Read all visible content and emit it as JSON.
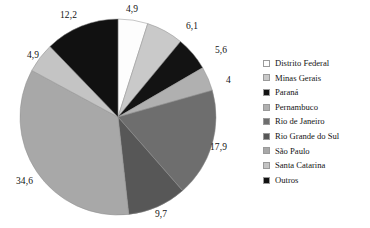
{
  "chart_data": {
    "type": "pie",
    "title": "",
    "categories": [
      "Distrito Federal",
      "Minas Gerais",
      "Paraná",
      "Pernambuco",
      "Rio de Janeiro",
      "Rio Grande do Sul",
      "São Paulo",
      "Santa Catarina",
      "Outros"
    ],
    "values": [
      4.9,
      6.1,
      5.6,
      4,
      17.9,
      9.7,
      34.6,
      4.9,
      12.2
    ],
    "labels": [
      "4,9",
      "6,1",
      "5,6",
      "4",
      "17,9",
      "9,7",
      "34,6",
      "4,9",
      "12,2"
    ],
    "colors": [
      "#fdfdfd",
      "#c9c9c9",
      "#131313",
      "#b0b0b0",
      "#6e6e6e",
      "#575757",
      "#a8a8a8",
      "#c4c4c4",
      "#111111"
    ],
    "start_angle_deg": 0,
    "direction": "clockwise",
    "legend_position": "right",
    "grid": false,
    "xlabel": "",
    "ylabel": ""
  },
  "legend": {
    "items": [
      {
        "label": "Distrito Federal",
        "color": "#fdfdfd"
      },
      {
        "label": "Minas Gerais",
        "color": "#c9c9c9"
      },
      {
        "label": "Paraná",
        "color": "#131313"
      },
      {
        "label": "Pernambuco",
        "color": "#b0b0b0"
      },
      {
        "label": "Rio de Janeiro",
        "color": "#6e6e6e"
      },
      {
        "label": "Rio Grande do Sul",
        "color": "#575757"
      },
      {
        "label": "São Paulo",
        "color": "#a8a8a8"
      },
      {
        "label": "Santa Catarina",
        "color": "#c4c4c4"
      },
      {
        "label": "Outros",
        "color": "#111111"
      }
    ]
  },
  "labels_layout": [
    {
      "text": "4,9",
      "left": 126,
      "top": 4
    },
    {
      "text": "6,1",
      "left": 186,
      "top": 21
    },
    {
      "text": "5,6",
      "left": 215,
      "top": 45
    },
    {
      "text": "4",
      "left": 226,
      "top": 75
    },
    {
      "text": "17,9",
      "left": 210,
      "top": 142
    },
    {
      "text": "9,7",
      "left": 155,
      "top": 209
    },
    {
      "text": "34,6",
      "left": 16,
      "top": 176
    },
    {
      "text": "4,9",
      "left": 27,
      "top": 50
    },
    {
      "text": "12,2",
      "left": 60,
      "top": 10
    }
  ]
}
